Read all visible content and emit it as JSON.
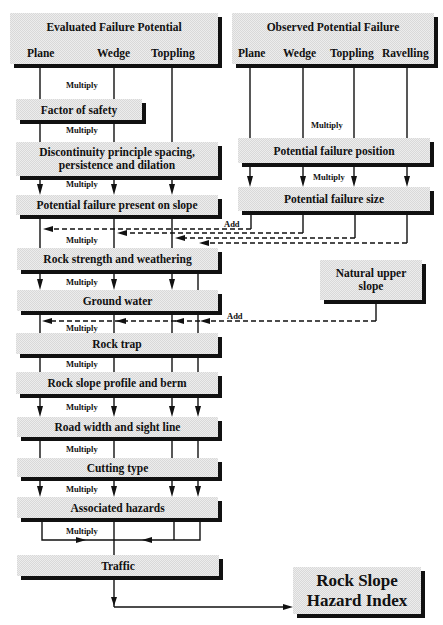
{
  "diagram": {
    "evaluated": {
      "title": "Evaluated Failure Potential",
      "columns": [
        "Plane",
        "Wedge",
        "Toppling"
      ]
    },
    "observed": {
      "title": "Observed Potential Failure",
      "columns": [
        "Plane",
        "Wedge",
        "Toppling",
        "Ravelling"
      ]
    },
    "boxes": {
      "factor_of_safety": "Factor of safety",
      "discontinuity": [
        "Discontinuity principle spacing,",
        "persistence and dilation"
      ],
      "potential_failure_present": "Potential failure present on slope",
      "potential_failure_position": "Potential failure position",
      "potential_failure_size": "Potential failure size",
      "rock_strength": "Rock strength and weathering",
      "natural_upper_slope": [
        "Natural upper",
        "slope"
      ],
      "ground_water": "Ground water",
      "rock_trap": "Rock trap",
      "rock_slope_profile": "Rock slope profile and berm",
      "road_width": "Road width and sight line",
      "cutting_type": "Cutting type",
      "associated_hazards": "Associated hazards",
      "traffic": "Traffic",
      "result": [
        "Rock Slope",
        "Hazard Index"
      ]
    },
    "operators": {
      "multiply": "Multiply",
      "add": "Add"
    }
  }
}
